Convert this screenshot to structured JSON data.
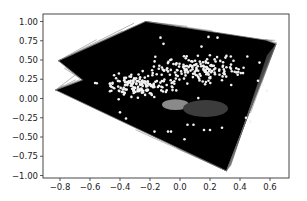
{
  "chart_data": {
    "type": "scatter",
    "title": "",
    "xlabel": "",
    "ylabel": "",
    "xlim": [
      -0.91,
      0.73
    ],
    "ylim": [
      -1.03,
      1.1
    ],
    "grid": false,
    "legend": null,
    "x_ticks": [
      -0.8,
      -0.6,
      -0.4,
      -0.2,
      0.0,
      0.2,
      0.4,
      0.6
    ],
    "x_tick_labels": [
      "−0.8",
      "−0.6",
      "−0.4",
      "−0.2",
      "0.0",
      "0.2",
      "0.4",
      "0.6"
    ],
    "y_ticks": [
      1.0,
      0.75,
      0.5,
      0.25,
      0.0,
      -0.25,
      -0.5,
      -0.75,
      -1.0
    ],
    "y_tick_labels": [
      "1.00",
      "0.75",
      "0.50",
      "0.25",
      "0.00",
      "−0.25",
      "−0.50",
      "−0.75",
      "−1.00"
    ],
    "hull_polygon": {
      "description": "black filled mesh of line segments connecting points (dense triangulation)",
      "color": "#000000",
      "edge_color": "#777777",
      "vertices": [
        [
          -0.23,
          1.0
        ],
        [
          0.57,
          0.76
        ],
        [
          0.64,
          0.71
        ],
        [
          0.31,
          -0.94
        ],
        [
          -0.83,
          0.11
        ],
        [
          -0.65,
          0.24
        ],
        [
          -0.81,
          0.49
        ]
      ]
    },
    "series": [
      {
        "name": "white-points-left-cluster",
        "color": "#f2f2f2",
        "center": [
          -0.27,
          0.17
        ],
        "spread": [
          0.12,
          0.08
        ],
        "count": 160
      },
      {
        "name": "white-points-right-cluster",
        "color": "#f2f2f2",
        "center": [
          0.13,
          0.39
        ],
        "spread": [
          0.13,
          0.09
        ],
        "count": 170
      },
      {
        "name": "white-points-scattered",
        "color": "#f2f2f2",
        "points": [
          [
            0.05,
            -0.34
          ],
          [
            0.09,
            -0.34
          ],
          [
            0.16,
            -0.41
          ],
          [
            0.2,
            -0.41
          ],
          [
            -0.08,
            -0.43
          ],
          [
            -0.06,
            -0.43
          ],
          [
            0.03,
            -0.53
          ],
          [
            -0.17,
            -0.43
          ],
          [
            0.44,
            -0.25
          ],
          [
            0.47,
            -0.3
          ],
          [
            0.52,
            0.23
          ],
          [
            0.55,
            0.18
          ],
          [
            0.58,
            0.1
          ],
          [
            -0.13,
            0.79
          ],
          [
            -0.11,
            0.71
          ],
          [
            0.19,
            0.8
          ],
          [
            0.25,
            0.79
          ],
          [
            0.34,
            0.44
          ],
          [
            0.42,
            0.33
          ],
          [
            -0.4,
            -0.18
          ],
          [
            -0.36,
            -0.26
          ],
          [
            0.28,
            -0.38
          ]
        ]
      },
      {
        "name": "gray-region-light",
        "color": "#8a8a8a",
        "center": [
          -0.03,
          -0.08
        ],
        "radius": [
          0.09,
          0.07
        ]
      },
      {
        "name": "gray-region-dark",
        "color": "#3c3c3c",
        "center": [
          0.17,
          -0.13
        ],
        "radius": [
          0.15,
          0.11
        ]
      }
    ]
  },
  "axes": {
    "box": {
      "left": 43,
      "top": 14,
      "right": 289,
      "bottom": 178
    },
    "origin_px": {
      "x": 180,
      "y": 98.5
    },
    "scale_px": {
      "x": 150,
      "y": 77
    }
  }
}
